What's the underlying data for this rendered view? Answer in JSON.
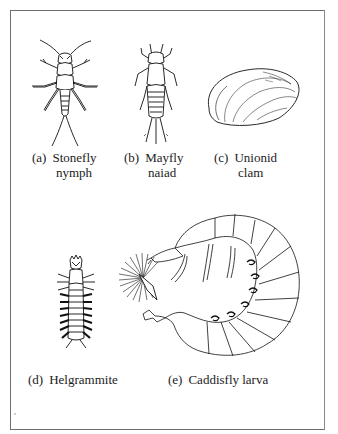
{
  "figure": {
    "type": "line-illustration plate",
    "border_color": "#6f6f6f",
    "panels": [
      {
        "id": "a",
        "tag": "(a)",
        "line1": "Stonefly",
        "line2": "nymph",
        "icon": "stonefly-nymph-icon"
      },
      {
        "id": "b",
        "tag": "(b)",
        "line1": "Mayfly",
        "line2": "naiad",
        "icon": "mayfly-naiad-icon"
      },
      {
        "id": "c",
        "tag": "(c)",
        "line1": "Unionid",
        "line2": "clam",
        "icon": "unionid-clam-icon"
      },
      {
        "id": "d",
        "tag": "(d)",
        "line1": "Helgrammite",
        "line2": "",
        "icon": "helgrammite-icon"
      },
      {
        "id": "e",
        "tag": "(e)",
        "line1": "Caddisfly larva",
        "line2": "",
        "icon": "caddisfly-larva-icon"
      }
    ]
  }
}
